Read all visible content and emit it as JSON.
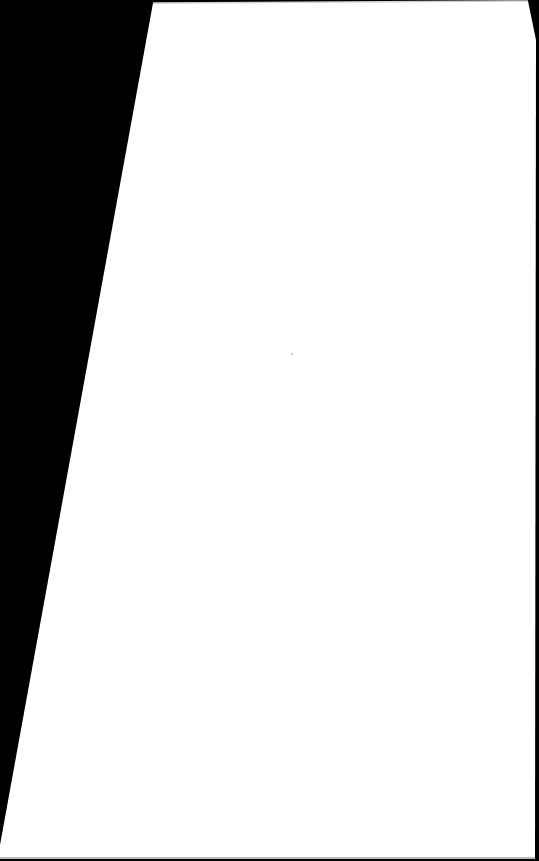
{
  "document": {
    "type": "blank scanned page",
    "text": "",
    "colors": {
      "background": "#000000",
      "paper": "#ffffff",
      "edge_shadow": "#d0d0d0"
    }
  }
}
